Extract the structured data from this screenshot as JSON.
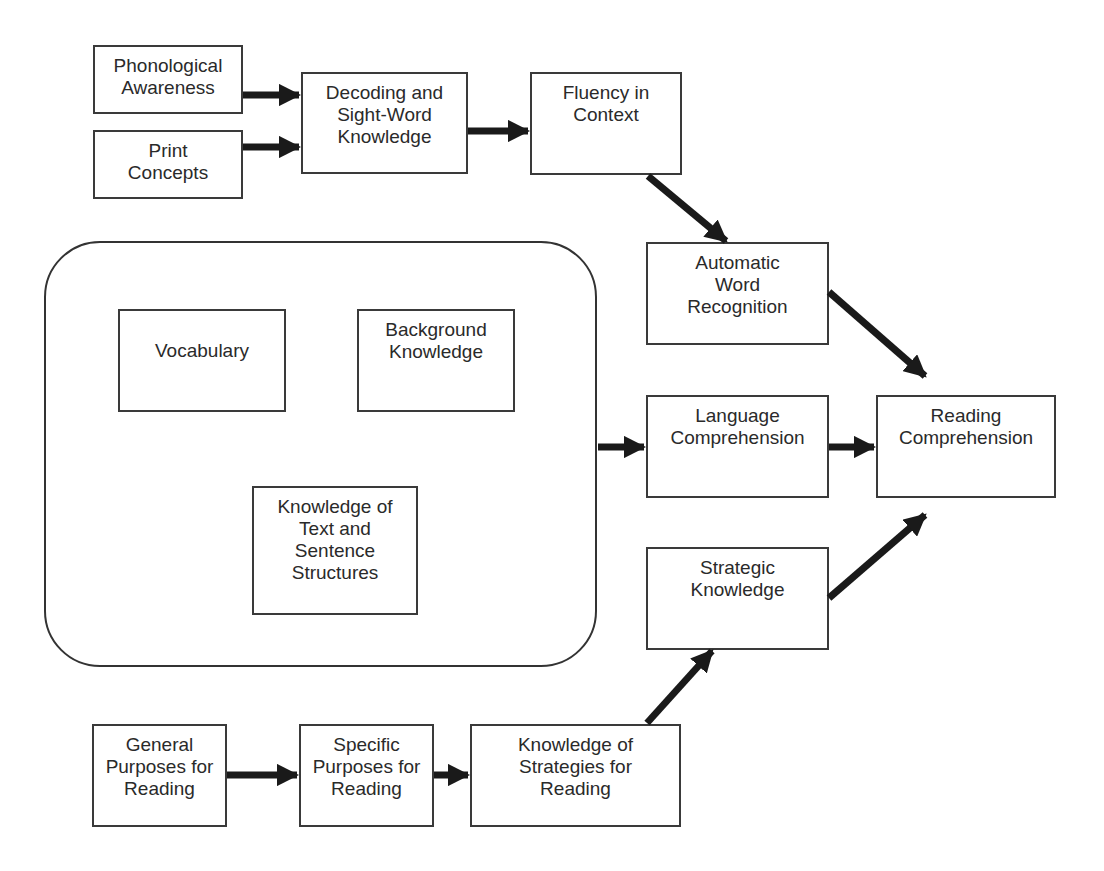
{
  "diagram": {
    "title": "",
    "container": {
      "name": "language-knowledge-group",
      "x": 44,
      "y": 241,
      "w": 553,
      "h": 426
    },
    "nodes": [
      {
        "id": "phonological",
        "label": "Phonological\nAwareness",
        "x": 93,
        "y": 45,
        "w": 150,
        "h": 69
      },
      {
        "id": "print",
        "label": "Print\nConcepts",
        "x": 93,
        "y": 130,
        "w": 150,
        "h": 69
      },
      {
        "id": "decoding",
        "label": "Decoding and\nSight-Word\nKnowledge",
        "x": 301,
        "y": 72,
        "w": 167,
        "h": 102
      },
      {
        "id": "fluency",
        "label": "Fluency in\nContext",
        "x": 530,
        "y": 72,
        "w": 152,
        "h": 103
      },
      {
        "id": "automatic",
        "label": "Automatic\nWord\nRecognition",
        "x": 646,
        "y": 242,
        "w": 183,
        "h": 103
      },
      {
        "id": "vocabulary",
        "label": "Vocabulary",
        "x": 118,
        "y": 309,
        "w": 168,
        "h": 103
      },
      {
        "id": "background",
        "label": "Background\nKnowledge",
        "x": 357,
        "y": 309,
        "w": 158,
        "h": 103
      },
      {
        "id": "text-structures",
        "label": "Knowledge of\nText and\nSentence\nStructures",
        "x": 252,
        "y": 486,
        "w": 166,
        "h": 129
      },
      {
        "id": "language",
        "label": "Language\nComprehension",
        "x": 646,
        "y": 395,
        "w": 183,
        "h": 103
      },
      {
        "id": "reading",
        "label": "Reading\nComprehension",
        "x": 876,
        "y": 395,
        "w": 180,
        "h": 103
      },
      {
        "id": "strategic",
        "label": "Strategic\nKnowledge",
        "x": 646,
        "y": 547,
        "w": 183,
        "h": 103
      },
      {
        "id": "general",
        "label": "General\nPurposes for\nReading",
        "x": 92,
        "y": 724,
        "w": 135,
        "h": 103
      },
      {
        "id": "specific",
        "label": "Specific\nPurposes for\nReading",
        "x": 299,
        "y": 724,
        "w": 135,
        "h": 103
      },
      {
        "id": "strategies",
        "label": "Knowledge of\nStrategies for\nReading",
        "x": 470,
        "y": 724,
        "w": 211,
        "h": 103
      }
    ],
    "edges": [
      {
        "from": "phonological",
        "to": "decoding",
        "x1": 243,
        "y1": 95,
        "x2": 299,
        "y2": 95
      },
      {
        "from": "print",
        "to": "decoding",
        "x1": 243,
        "y1": 147,
        "x2": 299,
        "y2": 147
      },
      {
        "from": "decoding",
        "to": "fluency",
        "x1": 468,
        "y1": 131,
        "x2": 528,
        "y2": 131
      },
      {
        "from": "fluency",
        "to": "automatic",
        "x1": 648,
        "y1": 176,
        "x2": 726,
        "y2": 241
      },
      {
        "from": "automatic",
        "to": "reading",
        "x1": 829,
        "y1": 292,
        "x2": 925,
        "y2": 376
      },
      {
        "from": "language-knowledge-group",
        "to": "language",
        "x1": 598,
        "y1": 447,
        "x2": 644,
        "y2": 447
      },
      {
        "from": "language",
        "to": "reading",
        "x1": 829,
        "y1": 447,
        "x2": 874,
        "y2": 447
      },
      {
        "from": "strategic",
        "to": "reading",
        "x1": 829,
        "y1": 598,
        "x2": 925,
        "y2": 515
      },
      {
        "from": "general",
        "to": "specific",
        "x1": 227,
        "y1": 775,
        "x2": 297,
        "y2": 775
      },
      {
        "from": "specific",
        "to": "strategies",
        "x1": 434,
        "y1": 775,
        "x2": 468,
        "y2": 775
      },
      {
        "from": "strategies",
        "to": "strategic",
        "x1": 647,
        "y1": 723,
        "x2": 712,
        "y2": 651
      }
    ],
    "colors": {
      "line": "#3a3a3a",
      "arrow": "#1a1a1a",
      "text": "#2a2a2a",
      "background": "#ffffff"
    }
  }
}
